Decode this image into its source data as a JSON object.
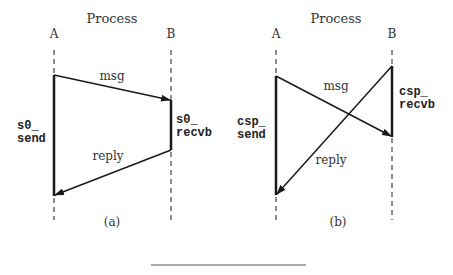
{
  "figure": {
    "panels": [
      {
        "id": "a",
        "title": "Process",
        "process_a_label": "A",
        "process_b_label": "B",
        "msg_label": "msg",
        "reply_label": "reply",
        "send_label_line1": "s0_",
        "send_label_line2": "send",
        "recv_label_line1": "s0_",
        "recv_label_line2": "recvb",
        "caption": "(a)"
      },
      {
        "id": "b",
        "title": "Process",
        "process_a_label": "A",
        "process_b_label": "B",
        "msg_label": "msg",
        "reply_label": "reply",
        "send_label_line1": "csp_",
        "send_label_line2": "send",
        "recv_label_line1": "csp_",
        "recv_label_line2": "recvb",
        "caption": "(b)"
      }
    ],
    "colors": {
      "line": "#1a1a1a",
      "text": "#333333",
      "rule": "#555555"
    }
  }
}
